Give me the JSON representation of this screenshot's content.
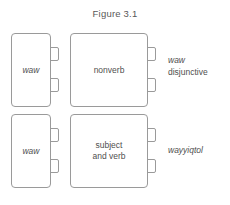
{
  "figure": {
    "title": "Figure 3.1",
    "rows": [
      {
        "id": "row-waw-disjunctive",
        "small_box": {
          "label": "waw",
          "style": "italic"
        },
        "large_box": {
          "label": "nonverb",
          "style": "roman"
        },
        "annotation": {
          "line1": "waw",
          "line1_style": "italic",
          "line2": "disjunctive",
          "line2_style": "roman"
        }
      },
      {
        "id": "row-wayyiqtol",
        "small_box": {
          "label": "waw",
          "style": "italic"
        },
        "large_box": {
          "label": "subject\nand verb",
          "label_line1": "subject",
          "label_line2": "and verb",
          "style": "roman"
        },
        "annotation": {
          "line1": "wayyiqtol",
          "line1_style": "italic",
          "line2": "",
          "line2_style": "roman"
        }
      }
    ],
    "colors": {
      "border": "#9a9a9a",
      "text": "#4f4f4f",
      "title_text": "#585858",
      "background": "#ffffff"
    }
  }
}
